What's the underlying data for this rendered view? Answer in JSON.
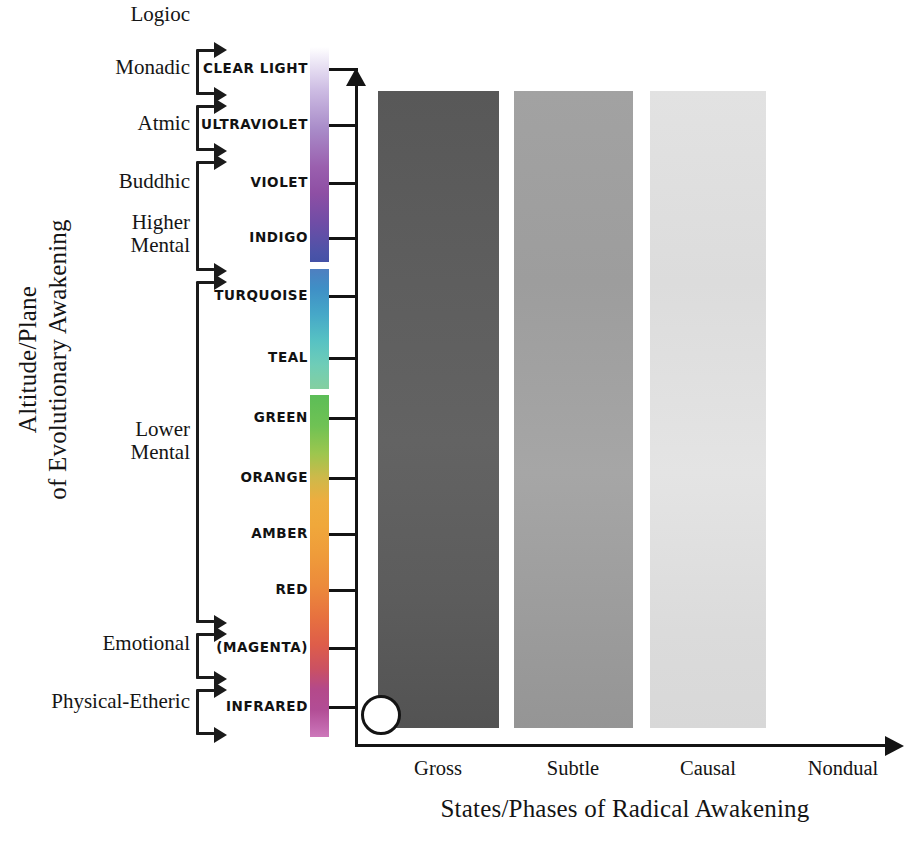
{
  "axes": {
    "y_title": "Altitude/Plane\nof Evolutionary Awakening",
    "x_title": "States/Phases of Radical Awakening"
  },
  "planes": [
    {
      "name": "Logioc",
      "top": 3,
      "height": 28,
      "grouped": false
    },
    {
      "name": "Monadic",
      "top": 56,
      "height": 28,
      "grouped": true
    },
    {
      "name": "Atmic",
      "top": 112,
      "height": 28,
      "grouped": true
    },
    {
      "name": "Buddhic",
      "top": 170,
      "height": 28,
      "grouped": true
    },
    {
      "name": "Higher\nMental",
      "top": 211,
      "height": 52,
      "grouped": true
    },
    {
      "name": "Lower\nMental",
      "top": 418,
      "height": 52,
      "grouped": true
    },
    {
      "name": "Emotional",
      "top": 632,
      "height": 28,
      "grouped": true
    },
    {
      "name": "Physical-Etheric",
      "top": 690,
      "height": 28,
      "grouped": true
    }
  ],
  "brackets": [
    {
      "label": "monadic",
      "top": 44,
      "height": 56
    },
    {
      "label": "atmic",
      "top": 100,
      "height": 56
    },
    {
      "label": "buddhic-higher",
      "top": 156,
      "height": 120
    },
    {
      "label": "turquoise-lower",
      "top": 276,
      "height": 352
    },
    {
      "label": "emotional",
      "top": 628,
      "height": 56
    },
    {
      "label": "physical-etheric",
      "top": 684,
      "height": 56
    }
  ],
  "altitudes": [
    {
      "name": "CLEAR LIGHT",
      "y": 69,
      "color": "#e9e4f2"
    },
    {
      "name": "ULTRAVIOLET",
      "y": 125,
      "color": "#b9a2d4"
    },
    {
      "name": "VIOLET",
      "y": 183,
      "color": "#8f63ac"
    },
    {
      "name": "INDIGO",
      "y": 238,
      "color": "#4f55a8"
    },
    {
      "name": "TURQUOISE",
      "y": 296,
      "color": "#3e8ec4"
    },
    {
      "name": "TEAL",
      "y": 358,
      "color": "#61c4c0"
    },
    {
      "name": "GREEN",
      "y": 418,
      "color": "#5cbb56"
    },
    {
      "name": "ORANGE",
      "y": 478,
      "color": "#f0a63a"
    },
    {
      "name": "AMBER",
      "y": 534,
      "color": "#ed8a3a"
    },
    {
      "name": "RED",
      "y": 590,
      "color": "#d9534b"
    },
    {
      "name": "(MAGENTA)",
      "y": 648,
      "color": "#b34a82"
    },
    {
      "name": "INFRARED",
      "y": 707,
      "color": "#cc6fb4"
    }
  ],
  "colorbar": {
    "segments": [
      {
        "name": "ultraviolet-band",
        "top": 0,
        "height": 215,
        "gradient": "linear-gradient(to bottom,#ffffff 0%,#efeaf7 6%,#cdbce3 20%,#a98cc9 38%,#9a5fae 56%,#8e4fa4 68%,#6f4da6 82%,#4b53a8 96%,#4451a6 100%)"
      },
      {
        "name": "turquoise-teal-band",
        "top": 222,
        "height": 120,
        "gradient": "linear-gradient(to bottom,#4e7fc0 0%,#3f8fc6 16%,#46a8c8 38%,#57c2c3 60%,#6fcdb7 80%,#84cfa0 100%)"
      },
      {
        "name": "green-to-magenta-band",
        "top": 348,
        "height": 342,
        "gradient": "linear-gradient(to bottom,#5cbd57 0%,#6fc254 9%,#9cc64e 17%,#cdb94a 24%,#eead3f 31%,#f0a83b 38%,#ef9b3a 47%,#ec8a3b 56%,#e7713f 65%,#de5d4a 73%,#cb5162 80%,#b4498a 86%,#b24d95 92%,#c267ad 97%,#cd78ba 100%)"
      }
    ]
  },
  "states": [
    {
      "label": "Gross",
      "left": 378,
      "width": 121,
      "center": 438,
      "gradient": "linear-gradient(to bottom,#585858 0%,#5d5d5d 25%,#636363 55%,#5c5c5c 80%,#535353 100%)"
    },
    {
      "label": "Subtle",
      "left": 514,
      "width": 119,
      "center": 573,
      "gradient": "linear-gradient(to bottom,#a2a2a2 0%,#9d9d9d 30%,#a6a6a6 60%,#9b9b9b 85%,#959595 100%)"
    },
    {
      "label": "Causal",
      "left": 650,
      "width": 116,
      "center": 708,
      "gradient": "linear-gradient(to bottom,#e2e2e2 0%,#dcdcdc 30%,#e4e4e4 60%,#dbdbdb 85%,#d8d8d8 100%)"
    },
    {
      "label": "Nondual",
      "left": 786,
      "width": 116,
      "center": 843,
      "gradient": "linear-gradient(to bottom,#ffffff 0%,#ffffff 100%)"
    }
  ],
  "origin_marker": {
    "name": "origin-circle"
  }
}
